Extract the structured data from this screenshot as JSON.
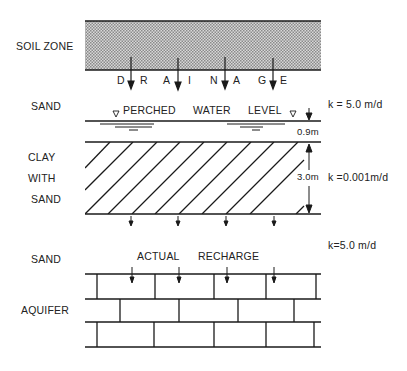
{
  "diagram": {
    "layers": [
      {
        "id": "soil",
        "label": "SOIL ZONE"
      },
      {
        "id": "sand_upper",
        "label": "SAND",
        "k": "k = 5.0 m/d"
      },
      {
        "id": "clay",
        "label_lines": [
          "CLAY",
          "WITH",
          "SAND"
        ],
        "k": "k =0.001m/d",
        "thickness": "3.0m"
      },
      {
        "id": "sand_lower",
        "label": "SAND",
        "k": "k=5.0  m/d"
      },
      {
        "id": "aquifer",
        "label": "AQUIFER"
      }
    ],
    "drainage_letters": [
      "D",
      "R",
      "A",
      "I",
      "N",
      "A",
      "G",
      "E"
    ],
    "perched_water": {
      "label_parts": [
        "PERCHED",
        "WATER",
        "LEVEL"
      ],
      "symbol": "▽",
      "height_above_clay": "0.9m"
    },
    "recharge_label_parts": [
      "ACTUAL",
      "RECHARGE"
    ],
    "colors": {
      "line": "#1a1a1a",
      "soil_fill": "#bdbdbd",
      "background": "#ffffff"
    }
  }
}
